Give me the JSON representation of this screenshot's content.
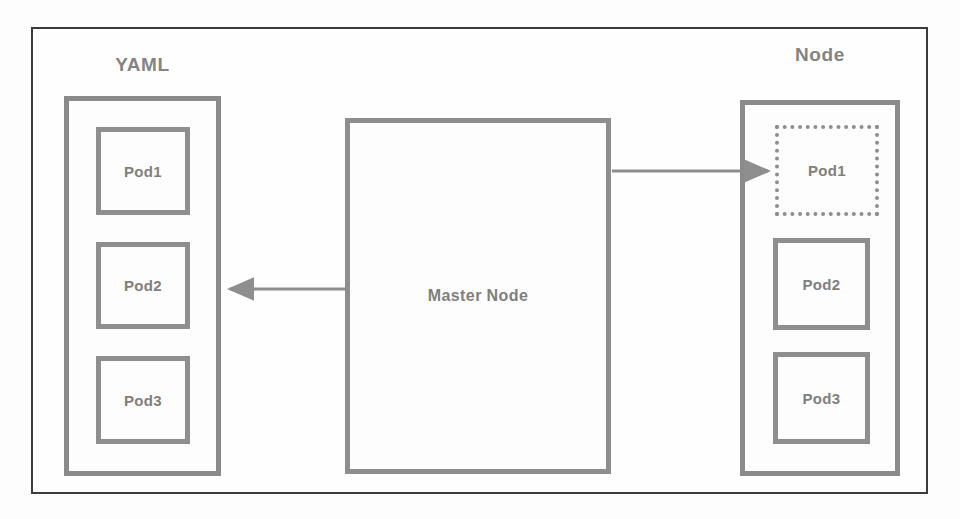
{
  "diagram": {
    "title_visible": false,
    "background_color": "#fdfdfd",
    "frame_color": "#3b3b3b",
    "shape_color": "#8e8e8e",
    "text_color": "#7f7f7f",
    "groups": {
      "left": {
        "label": "YAML",
        "pods": [
          {
            "label": "Pod1",
            "style": "solid"
          },
          {
            "label": "Pod2",
            "style": "solid"
          },
          {
            "label": "Pod3",
            "style": "solid"
          }
        ]
      },
      "right": {
        "label": "Node",
        "pods": [
          {
            "label": "Pod1",
            "style": "dotted"
          },
          {
            "label": "Pod2",
            "style": "solid"
          },
          {
            "label": "Pod3",
            "style": "solid"
          }
        ]
      }
    },
    "center": {
      "label": "Master Node"
    },
    "arrows": [
      {
        "name": "master-to-node-pod1",
        "direction": "right",
        "from": "Master Node",
        "to": "Node / Pod1"
      },
      {
        "name": "master-to-yaml",
        "direction": "left",
        "from": "Master Node",
        "to": "YAML"
      }
    ]
  }
}
